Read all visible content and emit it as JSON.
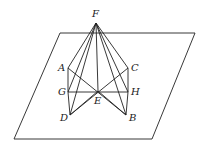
{
  "diagram": {
    "type": "3d-geometry",
    "plane": {
      "corners": [
        [
          60,
          33
        ],
        [
          195,
          33
        ],
        [
          152,
          139
        ],
        [
          14,
          139
        ]
      ]
    },
    "points": {
      "F": {
        "label": "F",
        "x": 96,
        "y": 23,
        "lx": 92,
        "ly": 17
      },
      "A": {
        "label": "A",
        "x": 68,
        "y": 68,
        "lx": 58,
        "ly": 71
      },
      "C": {
        "label": "C",
        "x": 128,
        "y": 68,
        "lx": 131,
        "ly": 71
      },
      "G": {
        "label": "G",
        "x": 68,
        "y": 92,
        "lx": 58,
        "ly": 95
      },
      "H": {
        "label": "H",
        "x": 128,
        "y": 92,
        "lx": 131,
        "ly": 95
      },
      "E": {
        "label": "E",
        "x": 98,
        "y": 91,
        "lx": 94,
        "ly": 104
      },
      "D": {
        "label": "D",
        "x": 70,
        "y": 115,
        "lx": 60,
        "ly": 121
      },
      "B": {
        "label": "B",
        "x": 126,
        "y": 115,
        "lx": 129,
        "ly": 121
      }
    },
    "segments": [
      [
        "F",
        "A"
      ],
      [
        "F",
        "C"
      ],
      [
        "F",
        "D"
      ],
      [
        "F",
        "B"
      ],
      [
        "F",
        "E"
      ],
      [
        "F",
        "G"
      ],
      [
        "F",
        "H"
      ],
      [
        "A",
        "G"
      ],
      [
        "G",
        "D"
      ],
      [
        "C",
        "H"
      ],
      [
        "H",
        "B"
      ],
      [
        "G",
        "H"
      ],
      [
        "A",
        "B"
      ],
      [
        "C",
        "D"
      ],
      [
        "D",
        "E"
      ],
      [
        "E",
        "B"
      ]
    ]
  }
}
